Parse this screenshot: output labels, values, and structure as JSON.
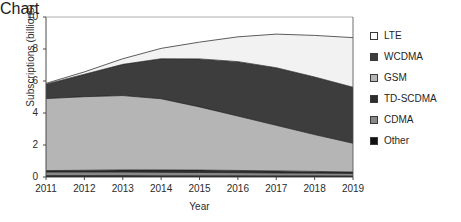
{
  "chart_data": {
    "type": "area",
    "title": "",
    "xlabel": "Year",
    "ylabel": "Subscriptions (billions)",
    "stacked": true,
    "grid": false,
    "legend_position": "right",
    "x": [
      2011,
      2012,
      2013,
      2014,
      2015,
      2016,
      2017,
      2018,
      2019
    ],
    "categories": [
      "2011",
      "2012",
      "2013",
      "2014",
      "2015",
      "2016",
      "2017",
      "2018",
      "2019"
    ],
    "xtick_labels": [
      "2011",
      "2012",
      "2013",
      "2014",
      "2015",
      "2016",
      "2017",
      "2018",
      "2019"
    ],
    "ytick_labels": [
      "0",
      "2",
      "4",
      "6",
      "8",
      "10"
    ],
    "ytick_values": [
      0,
      2,
      4,
      6,
      8,
      10
    ],
    "ylim": [
      0,
      10
    ],
    "xlim": [
      2011,
      2019
    ],
    "series": [
      {
        "name": "Other",
        "color": "#111111",
        "values": [
          0.09,
          0.09,
          0.09,
          0.08,
          0.08,
          0.08,
          0.07,
          0.07,
          0.06
        ]
      },
      {
        "name": "CDMA",
        "color": "#888888",
        "values": [
          0.22,
          0.22,
          0.22,
          0.21,
          0.2,
          0.19,
          0.18,
          0.17,
          0.16
        ]
      },
      {
        "name": "TD-SCDMA",
        "color": "#2e2e2e",
        "values": [
          0.09,
          0.11,
          0.13,
          0.15,
          0.15,
          0.14,
          0.13,
          0.11,
          0.09
        ]
      },
      {
        "name": "GSM",
        "color": "#b5b5b5",
        "values": [
          4.5,
          4.6,
          4.65,
          4.45,
          3.95,
          3.4,
          2.85,
          2.3,
          1.8
        ]
      },
      {
        "name": "WCDMA",
        "color": "#3d3d3d",
        "values": [
          0.9,
          1.4,
          1.95,
          2.5,
          3.0,
          3.4,
          3.6,
          3.6,
          3.5
        ]
      },
      {
        "name": "LTE",
        "color": "#f2f2f2",
        "values": [
          0.05,
          0.15,
          0.35,
          0.65,
          1.05,
          1.55,
          2.1,
          2.6,
          3.1
        ]
      }
    ],
    "totals": [
      5.85,
      6.57,
      7.39,
      8.04,
      8.43,
      8.76,
      8.93,
      8.85,
      8.71
    ],
    "legend": [
      {
        "label": "LTE",
        "color": "#ffffff"
      },
      {
        "label": "WCDMA",
        "color": "#3d3d3d"
      },
      {
        "label": "GSM",
        "color": "#b5b5b5"
      },
      {
        "label": "TD-SCDMA",
        "color": "#2e2e2e"
      },
      {
        "label": "CDMA",
        "color": "#888888"
      },
      {
        "label": "Other",
        "color": "#111111"
      }
    ]
  }
}
